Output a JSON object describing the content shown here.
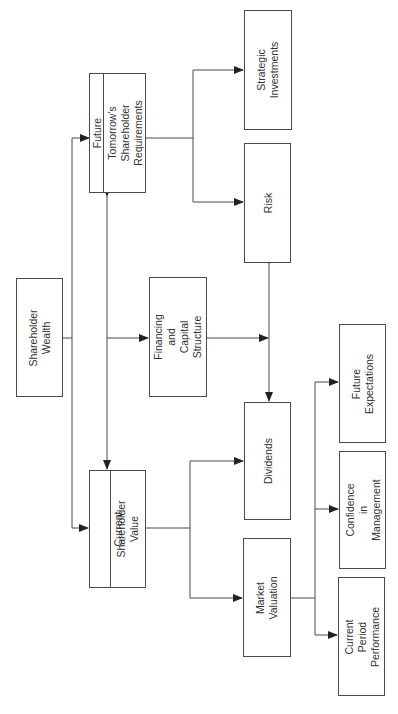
{
  "diagram": {
    "title": "",
    "orientation": "rotated -90deg",
    "colors": {
      "line": "#4a4a4a",
      "text": "#333333",
      "background": "#ffffff"
    },
    "nodes": {
      "shareholder_wealth": {
        "label": "Shareholder\nWealth"
      },
      "future": {
        "header": "Future",
        "label": "Tomorrow's\nShareholder\nRequirements"
      },
      "current": {
        "header": "Current",
        "label": "Shareholder\nValue"
      },
      "financing": {
        "label": "Financing\nand\nCapital\nStructure"
      },
      "strategic": {
        "label": "Strategic\nInvestments"
      },
      "risk": {
        "label": "Risk"
      },
      "dividends": {
        "label": "Dividends"
      },
      "market": {
        "label": "Market\nValuation"
      },
      "future_expectations": {
        "label": "Future\nExpectations"
      },
      "confidence": {
        "label": "Confidence\nin\nManagement"
      },
      "current_period": {
        "label": "Current\nPeriod\nPerformance"
      }
    },
    "edges": [
      {
        "from": "Shareholder Wealth",
        "to": "Future / Tomorrow's Shareholder Requirements"
      },
      {
        "from": "Shareholder Wealth",
        "to": "Current Shareholder Value"
      },
      {
        "from": "Future / Tomorrow's Shareholder Requirements",
        "to": "Current Shareholder Value",
        "bidirectional": true
      },
      {
        "from": "Future / Tomorrow's Shareholder Requirements",
        "to": "Financing and Capital Structure"
      },
      {
        "from": "Future / Tomorrow's Shareholder Requirements",
        "to": "Strategic Investments"
      },
      {
        "from": "Future / Tomorrow's Shareholder Requirements",
        "to": "Risk"
      },
      {
        "from": "Financing and Capital Structure",
        "to": "Risk / Dividends link"
      },
      {
        "from": "Risk",
        "to": "Dividends",
        "bidirectional": true
      },
      {
        "from": "Current Shareholder Value",
        "to": "Dividends"
      },
      {
        "from": "Current Shareholder Value",
        "to": "Market Valuation"
      },
      {
        "from": "Market Valuation",
        "to": "Future Expectations"
      },
      {
        "from": "Market Valuation",
        "to": "Confidence in Management"
      },
      {
        "from": "Market Valuation",
        "to": "Current Period Performance"
      }
    ]
  }
}
